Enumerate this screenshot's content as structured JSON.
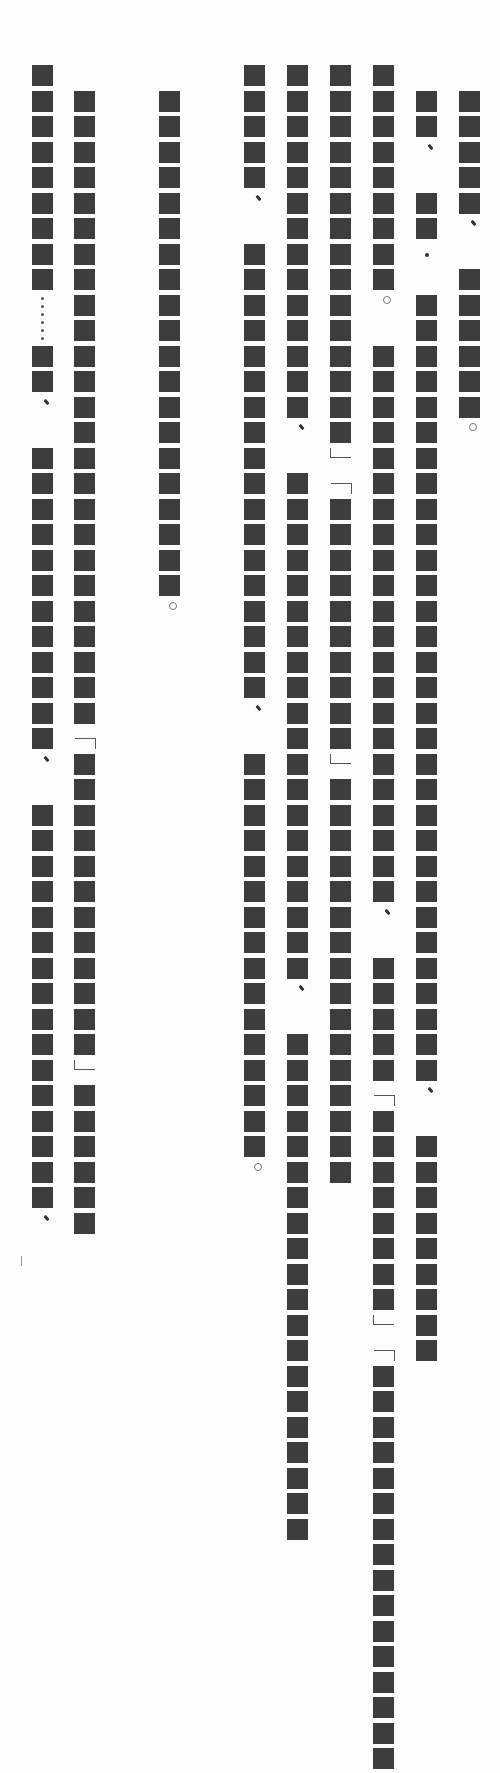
{
  "document": {
    "orientation": "vertical-rl",
    "note": "Text glyphs rendered as solid redaction blocks",
    "block_color": "#3d3d3d",
    "origin_y": 65,
    "row_pitch": 25.5,
    "legend": {
      "B": "block",
      "c": "comma",
      "p": "period",
      "d": "middle-dot",
      "e": "ellipsis",
      "o": "open-bracket",
      "x": "close-bracket",
      "_": "blank"
    },
    "columns": [
      {
        "x": 459,
        "start": 1,
        "cells": "BBBBBc_BBBBBBp"
      },
      {
        "x": 416,
        "start": 1,
        "cells": "BBc_BBd_BBBBBBBBBBBBBBBBBBBBBBBBBBBBBBBc_BBBBBBBBB"
      },
      {
        "x": 373,
        "start": 0,
        "cells": "BBBBBBBBBp_BBBBBBBBBBBBBBBBBBBBBBc_BBBBBoBBBBBBBBxoBBBBBBBBBBBBBBBB"
      },
      {
        "x": 330,
        "start": 0,
        "cells": "BBBBBBBBBBBBBBBxoBBBBBBBBBBxBBBBBBBBBBBBBBBB"
      },
      {
        "x": 287,
        "start": 0,
        "cells": "BBBBBBBBBBBBBBc_BBBBBBBBBBBBBBBBBBBBc_BBBBBBBBBBBBBBBBBBBB"
      },
      {
        "x": 244,
        "start": 0,
        "cells": "BBBBBc_BBBBBBBBBBBBBBBBBBc_BBBBBBBBBBBBBBBBp"
      },
      {
        "x": 159,
        "start": 1,
        "cells": "BBBBBBBBBBBBBBBBBBBBp"
      },
      {
        "x": 74,
        "start": 1,
        "cells": "BBBBBBBBBBBBBBBBBBBBBBBBBoBBBBBBBBBBBBxBBBBBB"
      },
      {
        "x": 32,
        "start": 0,
        "cells": "BBBBBBBBBe_BBc_BBBBBBBBBBBBc_BBBBBBBBBBBBBBBBc"
      }
    ]
  }
}
